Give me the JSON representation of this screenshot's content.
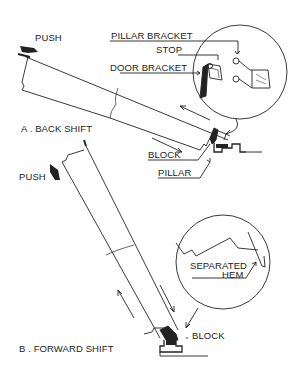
{
  "diagram": {
    "section_a": {
      "title": "A . BACK SHIFT",
      "push_label": "PUSH",
      "callouts": {
        "pillar_bracket": "PILLAR BRACKET",
        "stop": "STOP",
        "door_bracket": "DOOR BRACKET",
        "block": "BLOCK",
        "pillar": "PILLAR"
      }
    },
    "section_b": {
      "title": "B . FORWARD SHIFT",
      "push_label": "PUSH",
      "callouts": {
        "separated_hem_line1": "SEPARATED",
        "separated_hem_line2": "HEM",
        "block": "BLOCK"
      }
    },
    "colors": {
      "ink": "#222222",
      "background": "#ffffff"
    }
  }
}
